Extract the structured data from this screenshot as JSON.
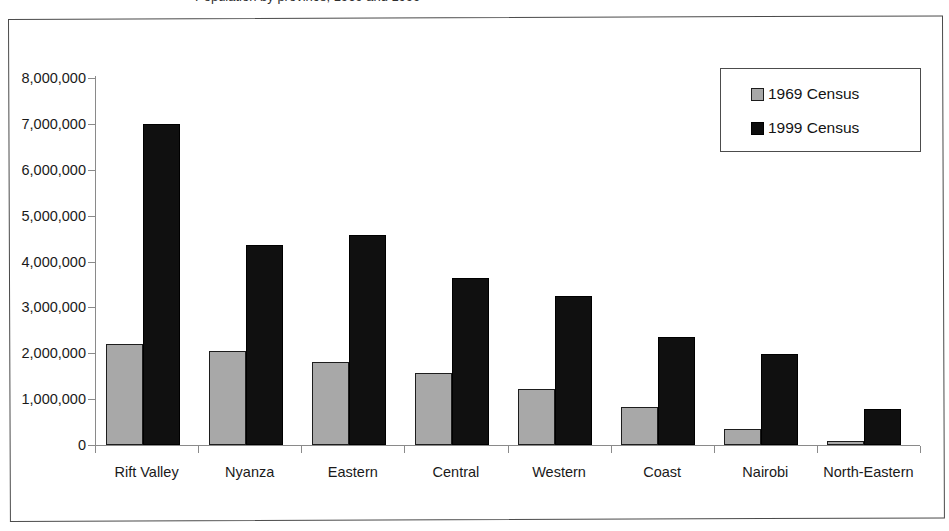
{
  "title": {
    "text": "Population by province, 1969 and 1999",
    "cropped": true
  },
  "legend": {
    "position": "top-right",
    "entries": [
      {
        "label": "1969 Census",
        "color": "#a8a8a8",
        "swatch": "square-gray"
      },
      {
        "label": "1999 Census",
        "color": "#101010",
        "swatch": "square-black"
      }
    ]
  },
  "axes": {
    "y_tick_labels": [
      "8,000,000",
      "7,000,000",
      "6,000,000",
      "5,000,000",
      "4,000,000",
      "3,000,000",
      "2,000,000",
      "1,000,000",
      "0"
    ],
    "x_tick_labels": [
      "Rift Valley",
      "Nyanza",
      "Eastern",
      "Central",
      "Western",
      "Coast",
      "Nairobi",
      "North-Eastern"
    ]
  },
  "chart_data": {
    "type": "bar",
    "title": "Population by province, 1969 and 1999",
    "xlabel": "",
    "ylabel": "",
    "ylim": [
      0,
      8000000
    ],
    "ytick_step": 1000000,
    "grid": false,
    "legend_position": "top-right",
    "categories": [
      "Rift Valley",
      "Nyanza",
      "Eastern",
      "Central",
      "Western",
      "Coast",
      "Nairobi",
      "North-Eastern"
    ],
    "series": [
      {
        "name": "1969 Census",
        "color": "#a8a8a8",
        "values": [
          2200000,
          2050000,
          1820000,
          1570000,
          1210000,
          820000,
          350000,
          90000
        ]
      },
      {
        "name": "1999 Census",
        "color": "#101010",
        "values": [
          6990000,
          4370000,
          4570000,
          3650000,
          3250000,
          2360000,
          1980000,
          790000
        ]
      }
    ]
  }
}
